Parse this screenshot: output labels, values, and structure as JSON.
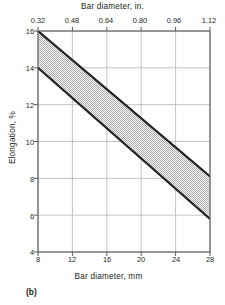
{
  "figure": {
    "caption": "(b)"
  },
  "chart_data": {
    "type": "area",
    "title": "",
    "xlabel": "Bar diameter, mm",
    "xlabel_top": "Bar diameter, in.",
    "ylabel": "Elongation, %",
    "xlim": [
      8,
      28
    ],
    "ylim": [
      4,
      16
    ],
    "xlim_top": [
      0.32,
      1.12
    ],
    "grid": true,
    "legend": "none",
    "x_ticks": [
      8,
      12,
      16,
      20,
      24,
      28
    ],
    "x_tick_labels": [
      "8",
      "12",
      "16",
      "20",
      "24",
      "28"
    ],
    "x_ticks_top": [
      0.32,
      0.48,
      0.64,
      0.8,
      0.96,
      1.12
    ],
    "x_tick_labels_top": [
      "0.32",
      "0.48",
      "0.64",
      "0.80",
      "0.96",
      "1.12"
    ],
    "y_ticks": [
      4,
      6,
      8,
      10,
      12,
      14,
      16
    ],
    "y_tick_labels": [
      "4",
      "6",
      "8",
      "10",
      "12",
      "14",
      "16"
    ],
    "band_fill": "#d2d2d2",
    "line_color": "#231f20",
    "grid_color": "#b5b5b5",
    "axis_color": "#6d6d6d",
    "series": [
      {
        "name": "upper bound",
        "x": [
          8,
          28
        ],
        "values": [
          16.0,
          8.1
        ]
      },
      {
        "name": "lower bound",
        "x": [
          8,
          28
        ],
        "values": [
          14.0,
          5.8
        ]
      }
    ]
  }
}
